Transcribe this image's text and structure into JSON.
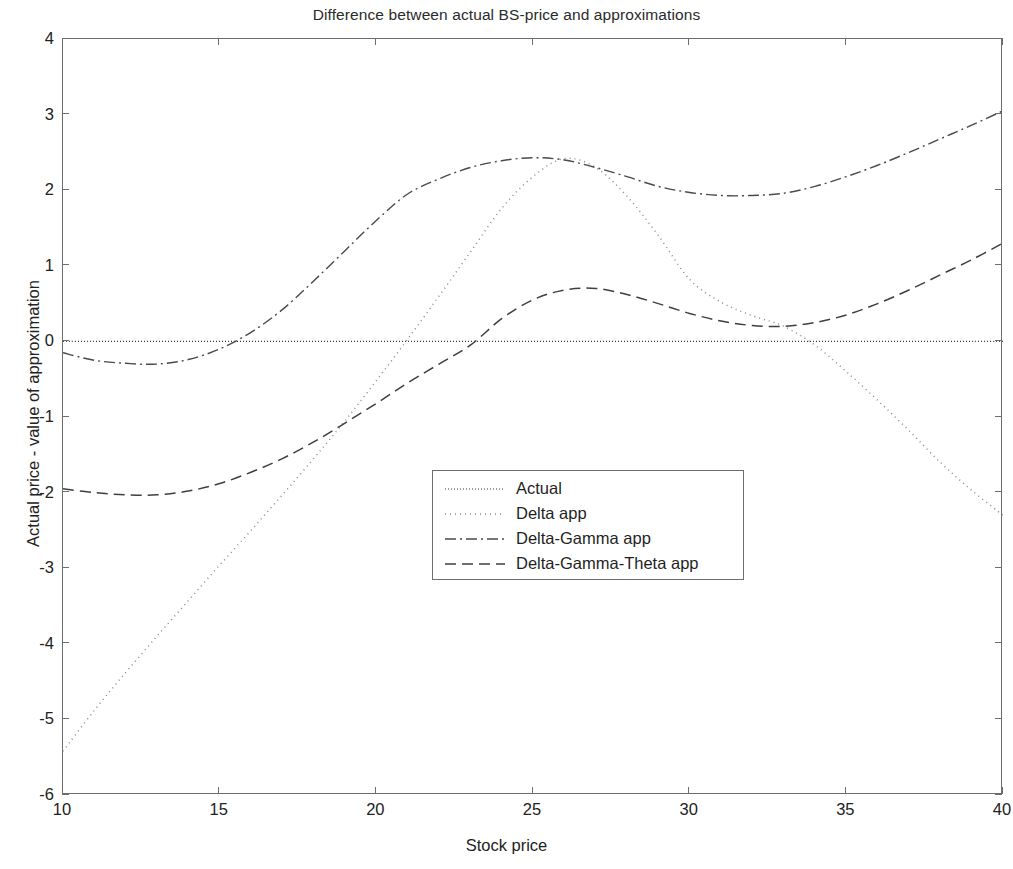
{
  "chart_data": {
    "type": "line",
    "title": "Difference between actual BS-price and approximations",
    "xlabel": "Stock price",
    "ylabel": "Actual price - value of approximation",
    "xlim": [
      10,
      40
    ],
    "ylim": [
      -6,
      4
    ],
    "xticks": [
      10,
      15,
      20,
      25,
      30,
      35,
      40
    ],
    "yticks": [
      4,
      3,
      2,
      1,
      0,
      -1,
      -2,
      -3,
      -4,
      -5,
      -6
    ],
    "grid": false,
    "legend_position": "center",
    "x": [
      10,
      11,
      12,
      13,
      14,
      15,
      16,
      17,
      18,
      19,
      20,
      21,
      22,
      23,
      24,
      25,
      26,
      27,
      28,
      29,
      30,
      31,
      32,
      33,
      34,
      35,
      36,
      37,
      38,
      39,
      40
    ],
    "series": [
      {
        "name": "Actual",
        "style": "dotted-fine",
        "color": "#3b3b3b",
        "values": [
          0,
          0,
          0,
          0,
          0,
          0,
          0,
          0,
          0,
          0,
          0,
          0,
          0,
          0,
          0,
          0,
          0,
          0,
          0,
          0,
          0,
          0,
          0,
          0,
          0,
          0,
          0,
          0,
          0,
          0,
          0
        ]
      },
      {
        "name": "Delta app",
        "style": "dotted",
        "color": "#8c8c8c",
        "values": [
          -5.42,
          -4.88,
          -4.38,
          -3.9,
          -3.43,
          -2.96,
          -2.5,
          -2.03,
          -1.55,
          -1.05,
          -0.52,
          0.03,
          0.6,
          1.18,
          1.76,
          2.18,
          2.42,
          2.3,
          1.92,
          1.4,
          0.82,
          0.52,
          0.34,
          0.2,
          -0.05,
          -0.4,
          -0.78,
          -1.18,
          -1.6,
          -1.97,
          -2.3
        ]
      },
      {
        "name": "Delta-Gamma app",
        "style": "dashdot",
        "color": "#4a4a4a",
        "values": [
          -0.15,
          -0.25,
          -0.29,
          -0.3,
          -0.24,
          -0.1,
          0.12,
          0.42,
          0.8,
          1.2,
          1.6,
          1.95,
          2.15,
          2.3,
          2.39,
          2.43,
          2.4,
          2.3,
          2.18,
          2.05,
          1.97,
          1.93,
          1.93,
          1.96,
          2.05,
          2.18,
          2.33,
          2.5,
          2.68,
          2.86,
          3.05
        ]
      },
      {
        "name": "Delta-Gamma-Theta app",
        "style": "dashed",
        "color": "#3f3f3f",
        "values": [
          -1.95,
          -2.0,
          -2.03,
          -2.03,
          -1.98,
          -1.88,
          -1.73,
          -1.55,
          -1.33,
          -1.08,
          -0.82,
          -0.55,
          -0.3,
          -0.05,
          0.3,
          0.55,
          0.68,
          0.7,
          0.62,
          0.5,
          0.37,
          0.27,
          0.21,
          0.2,
          0.25,
          0.35,
          0.5,
          0.68,
          0.88,
          1.08,
          1.3
        ]
      }
    ]
  },
  "axes": {
    "xtick_labels": [
      "10",
      "15",
      "20",
      "25",
      "30",
      "35",
      "40"
    ],
    "ytick_labels": [
      "4",
      "3",
      "2",
      "1",
      "0",
      "-1",
      "-2",
      "-3",
      "-4",
      "-5",
      "-6"
    ]
  },
  "legend": {
    "items": [
      {
        "label": "Actual",
        "style": "dotted-fine"
      },
      {
        "label": "Delta app",
        "style": "dotted"
      },
      {
        "label": "Delta-Gamma app",
        "style": "dashdot"
      },
      {
        "label": "Delta-Gamma-Theta app",
        "style": "dashed"
      }
    ]
  },
  "colors": {
    "axis": "#6e6e6e",
    "text": "#222222",
    "background": "#ffffff"
  }
}
